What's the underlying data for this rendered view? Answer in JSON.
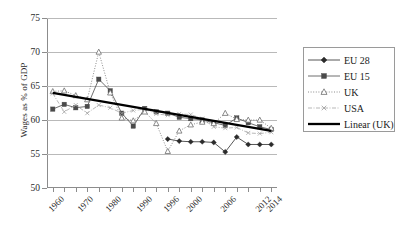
{
  "chart_data": {
    "type": "line",
    "title": "",
    "xlabel": "",
    "ylabel": "Wages as % of GDP",
    "ylim": [
      50,
      75
    ],
    "yticks": [
      50,
      55,
      60,
      65,
      70,
      75
    ],
    "grid": "horizontal",
    "legend_position": "right-outside",
    "x": [
      1960,
      1964,
      1968,
      1972,
      1976,
      1980,
      1984,
      1988,
      1991,
      1994,
      1996,
      1998,
      2000,
      2002,
      2004,
      2006,
      2008,
      2010,
      2012,
      2014
    ],
    "xtick_labels": [
      "1960",
      "1970",
      "1980",
      "1990",
      "1996",
      "2000",
      "2006",
      "2012",
      "2014"
    ],
    "xtick_label_values": [
      1960,
      1970,
      1980,
      1990,
      1996,
      2000,
      2006,
      2012,
      2014
    ],
    "series": [
      {
        "name": "EU 28",
        "marker": "filled-diamond",
        "line": "solid-thin",
        "color": "#2b2b2b",
        "x": [
          1996,
          1998,
          2000,
          2002,
          2004,
          2006,
          2008,
          2010,
          2012,
          2014
        ],
        "values": [
          57.2,
          56.9,
          56.8,
          56.8,
          56.7,
          55.3,
          57.5,
          56.4,
          56.4,
          56.4
        ]
      },
      {
        "name": "EU 15",
        "marker": "filled-square",
        "line": "solid-thin",
        "color": "#4a4a4a",
        "x": [
          1960,
          1964,
          1968,
          1972,
          1976,
          1980,
          1984,
          1988,
          1991,
          1994,
          1996,
          1998,
          2000,
          2002,
          2004,
          2006,
          2008,
          2010,
          2012,
          2014
        ],
        "values": [
          61.6,
          62.3,
          61.8,
          62.0,
          66.0,
          64.3,
          61.0,
          59.1,
          61.7,
          61.2,
          61.0,
          60.4,
          60.2,
          60.0,
          59.6,
          59.2,
          60.3,
          59.6,
          59.0,
          58.6
        ]
      },
      {
        "name": "UK",
        "marker": "open-triangle",
        "line": "dotted",
        "color": "#6e6e6e",
        "x": [
          1960,
          1964,
          1968,
          1972,
          1976,
          1980,
          1984,
          1988,
          1991,
          1994,
          1996,
          1998,
          2000,
          2002,
          2004,
          2006,
          2008,
          2010,
          2012,
          2014
        ],
        "values": [
          64.2,
          64.3,
          63.6,
          63.0,
          70.0,
          64.0,
          60.3,
          59.9,
          61.2,
          59.5,
          55.4,
          58.4,
          59.3,
          59.7,
          59.5,
          61.0,
          60.1,
          60.0,
          60.0,
          58.8
        ]
      },
      {
        "name": "USA",
        "marker": "small-x",
        "line": "dash-dot",
        "color": "#9a9a9a",
        "x": [
          1960,
          1964,
          1968,
          1972,
          1976,
          1980,
          1984,
          1988,
          1991,
          1994,
          1996,
          1998,
          2000,
          2002,
          2004,
          2006,
          2008,
          2010,
          2012,
          2014
        ],
        "values": [
          63.9,
          61.2,
          62.2,
          61.0,
          62.2,
          61.8,
          61.0,
          61.4,
          61.6,
          60.9,
          60.7,
          60.9,
          60.8,
          60.2,
          59.0,
          58.8,
          58.9,
          58.1,
          58.0,
          58.2
        ]
      },
      {
        "name": "Linear (UK)",
        "marker": "none",
        "line": "solid-thick",
        "color": "#000000",
        "x": [
          1960,
          2014
        ],
        "values": [
          64.0,
          58.4
        ]
      }
    ],
    "legend": [
      {
        "label": "EU 28",
        "marker": "filled-diamond",
        "line": "solid-thin",
        "color": "#2b2b2b"
      },
      {
        "label": "EU 15",
        "marker": "filled-square",
        "line": "solid-thin",
        "color": "#4a4a4a"
      },
      {
        "label": "UK",
        "marker": "open-triangle",
        "line": "dotted",
        "color": "#6e6e6e"
      },
      {
        "label": "USA",
        "marker": "small-x",
        "line": "dash-dot",
        "color": "#9a9a9a"
      },
      {
        "label": "Linear (UK)",
        "marker": "none",
        "line": "solid-thick",
        "color": "#000000"
      }
    ]
  }
}
